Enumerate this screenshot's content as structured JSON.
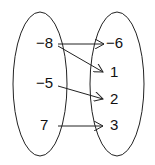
{
  "diagram": {
    "type": "mapping",
    "domain": {
      "values": [
        {
          "label": "−8",
          "x": 50,
          "y": 48
        },
        {
          "label": "−5",
          "x": 50,
          "y": 88
        },
        {
          "label": "7",
          "x": 46,
          "y": 130
        }
      ]
    },
    "range": {
      "values": [
        {
          "label": "−6",
          "x": 107,
          "y": 48
        },
        {
          "label": "1",
          "x": 110,
          "y": 77
        },
        {
          "label": "2",
          "x": 110,
          "y": 104
        },
        {
          "label": "3",
          "x": 110,
          "y": 130
        }
      ]
    },
    "mappings": [
      {
        "from": "−8",
        "to": "−6"
      },
      {
        "from": "−8",
        "to": "1"
      },
      {
        "from": "−5",
        "to": "2"
      },
      {
        "from": "7",
        "to": "3"
      }
    ],
    "colors": {
      "stroke": "#222222",
      "text": "#111111",
      "background": "#ffffff"
    }
  }
}
